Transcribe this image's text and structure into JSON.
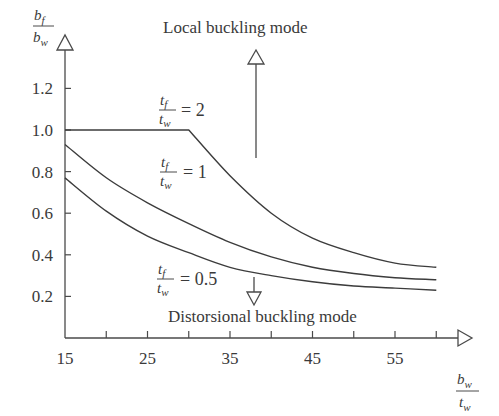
{
  "chart_data": {
    "type": "line",
    "title": "",
    "xlabel": "b_w / t_w",
    "ylabel": "b_f / b_w",
    "xlim": [
      15,
      60
    ],
    "ylim": [
      0,
      1.2
    ],
    "x_ticks": [
      15,
      25,
      35,
      45,
      55
    ],
    "x_minor_ticks": [
      20,
      30,
      40,
      50,
      60
    ],
    "y_ticks": [
      0.2,
      0.4,
      0.6,
      0.8,
      1.0,
      1.2
    ],
    "x_tick_labels": [
      "15",
      "25",
      "35",
      "45",
      "55"
    ],
    "y_tick_labels": [
      "0.2",
      "0.4",
      "0.6",
      "0.8",
      "1.0",
      "1.2"
    ],
    "grid": false,
    "legend": "inline curve labels",
    "series": [
      {
        "name": "tf/tw = 2",
        "label_lhs_num": "t",
        "label_lhs_num_sub": "f",
        "label_lhs_den": "t",
        "label_lhs_den_sub": "w",
        "label_rhs": "= 2",
        "x": [
          15,
          20,
          25,
          30,
          35,
          40,
          45,
          50,
          55,
          60
        ],
        "values": [
          1.0,
          1.0,
          1.0,
          1.0,
          0.78,
          0.6,
          0.48,
          0.41,
          0.36,
          0.34
        ]
      },
      {
        "name": "tf/tw = 1",
        "label_lhs_num": "t",
        "label_lhs_num_sub": "f",
        "label_lhs_den": "t",
        "label_lhs_den_sub": "w",
        "label_rhs": "= 1",
        "x": [
          15,
          20,
          25,
          30,
          35,
          40,
          45,
          50,
          55,
          60
        ],
        "values": [
          0.93,
          0.77,
          0.65,
          0.55,
          0.46,
          0.39,
          0.34,
          0.31,
          0.29,
          0.28
        ]
      },
      {
        "name": "tf/tw = 0.5",
        "label_lhs_num": "t",
        "label_lhs_num_sub": "f",
        "label_lhs_den": "t",
        "label_lhs_den_sub": "w",
        "label_rhs": "= 0.5",
        "x": [
          15,
          20,
          25,
          30,
          35,
          40,
          45,
          50,
          55,
          60
        ],
        "values": [
          0.77,
          0.61,
          0.49,
          0.41,
          0.34,
          0.3,
          0.27,
          0.25,
          0.24,
          0.23
        ]
      }
    ],
    "annotations": [
      {
        "text": "Local buckling mode",
        "arrow": "up"
      },
      {
        "text": "Distorsional buckling mode",
        "arrow": "down"
      }
    ]
  },
  "axes": {
    "y_label_num": "b",
    "y_label_num_sub": "f",
    "y_label_den": "b",
    "y_label_den_sub": "w",
    "x_label_num": "b",
    "x_label_num_sub": "w",
    "x_label_den": "t",
    "x_label_den_sub": "w"
  },
  "annotations": {
    "local": "Local buckling mode",
    "distortional": "Distorsional buckling mode"
  },
  "colors": {
    "line": "#3c3c3c",
    "axis": "#4a4a4a",
    "text": "#3a3a3a",
    "background": "#ffffff"
  }
}
